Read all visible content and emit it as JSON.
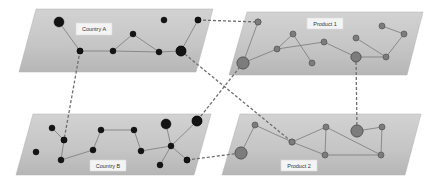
{
  "diagram": {
    "type": "multilayer-network",
    "colors": {
      "plane_fill_top": "#cfcfcf",
      "plane_fill_bottom": "#b9b9b9",
      "country_node": "#141414",
      "product_node": "#7c7c7c",
      "edge": "#7a7a7a",
      "interlayer_link": "#6f6f6f"
    },
    "planes": [
      {
        "id": "country-a",
        "label": "Country A",
        "points": "36,9 213,9 196,72 19,72",
        "label_box": {
          "x": 76,
          "y": 23,
          "w": 36,
          "h": 12
        },
        "node_class": "node-country",
        "nodes": [
          {
            "x": 59,
            "y": 22,
            "r": 5
          },
          {
            "x": 80,
            "y": 51,
            "r": 3
          },
          {
            "x": 113,
            "y": 51,
            "r": 3
          },
          {
            "x": 133,
            "y": 34,
            "r": 3
          },
          {
            "x": 159,
            "y": 52,
            "r": 3
          },
          {
            "x": 164,
            "y": 20,
            "r": 3
          },
          {
            "x": 181,
            "y": 51,
            "r": 5
          },
          {
            "x": 198,
            "y": 20,
            "r": 3
          }
        ],
        "edges": [
          [
            0,
            1
          ],
          [
            1,
            2
          ],
          [
            2,
            3
          ],
          [
            3,
            4
          ],
          [
            2,
            4
          ],
          [
            4,
            6
          ],
          [
            6,
            7
          ]
        ]
      },
      {
        "id": "product-1",
        "label": "Product 1",
        "points": "247,12 423,12 407,75 229,75",
        "label_box": {
          "x": 307,
          "y": 18,
          "w": 36,
          "h": 11
        },
        "node_class": "node-product",
        "nodes": [
          {
            "x": 258,
            "y": 22,
            "r": 3
          },
          {
            "x": 243,
            "y": 63,
            "r": 6
          },
          {
            "x": 277,
            "y": 49,
            "r": 3
          },
          {
            "x": 293,
            "y": 34,
            "r": 3
          },
          {
            "x": 312,
            "y": 63,
            "r": 3
          },
          {
            "x": 324,
            "y": 42,
            "r": 3
          },
          {
            "x": 356,
            "y": 57,
            "r": 5
          },
          {
            "x": 356,
            "y": 38,
            "r": 3
          },
          {
            "x": 386,
            "y": 57,
            "r": 3
          },
          {
            "x": 382,
            "y": 26,
            "r": 3
          },
          {
            "x": 404,
            "y": 34,
            "r": 3
          }
        ],
        "edges": [
          [
            0,
            1
          ],
          [
            1,
            2
          ],
          [
            2,
            3
          ],
          [
            3,
            4
          ],
          [
            2,
            5
          ],
          [
            5,
            6
          ],
          [
            6,
            8
          ],
          [
            7,
            8
          ],
          [
            8,
            10
          ],
          [
            9,
            10
          ]
        ]
      },
      {
        "id": "country-b",
        "label": "Country B",
        "points": "33,114 211,114 194,175 16,175",
        "label_box": {
          "x": 90,
          "y": 160,
          "w": 36,
          "h": 11
        },
        "node_class": "node-country",
        "nodes": [
          {
            "x": 52,
            "y": 128,
            "r": 3
          },
          {
            "x": 64,
            "y": 140,
            "r": 3
          },
          {
            "x": 36,
            "y": 152,
            "r": 3
          },
          {
            "x": 61,
            "y": 160,
            "r": 3
          },
          {
            "x": 101,
            "y": 130,
            "r": 3
          },
          {
            "x": 93,
            "y": 150,
            "r": 3
          },
          {
            "x": 134,
            "y": 130,
            "r": 3
          },
          {
            "x": 141,
            "y": 151,
            "r": 3
          },
          {
            "x": 166,
            "y": 124,
            "r": 5
          },
          {
            "x": 197,
            "y": 121,
            "r": 5
          },
          {
            "x": 171,
            "y": 146,
            "r": 3
          },
          {
            "x": 160,
            "y": 165,
            "r": 3
          },
          {
            "x": 187,
            "y": 160,
            "r": 3
          }
        ],
        "edges": [
          [
            0,
            1
          ],
          [
            1,
            3
          ],
          [
            3,
            5
          ],
          [
            5,
            4
          ],
          [
            4,
            6
          ],
          [
            6,
            7
          ],
          [
            7,
            10
          ],
          [
            8,
            10
          ],
          [
            10,
            9
          ],
          [
            10,
            11
          ],
          [
            10,
            12
          ]
        ]
      },
      {
        "id": "product-2",
        "label": "Product 2",
        "points": "240,114 421,114 405,175 222,175",
        "label_box": {
          "x": 281,
          "y": 160,
          "w": 36,
          "h": 11
        },
        "node_class": "node-product",
        "nodes": [
          {
            "x": 255,
            "y": 125,
            "r": 3
          },
          {
            "x": 241,
            "y": 153,
            "r": 6
          },
          {
            "x": 292,
            "y": 142,
            "r": 3
          },
          {
            "x": 326,
            "y": 127,
            "r": 3
          },
          {
            "x": 325,
            "y": 155,
            "r": 3
          },
          {
            "x": 357,
            "y": 131,
            "r": 6
          },
          {
            "x": 382,
            "y": 127,
            "r": 3
          },
          {
            "x": 381,
            "y": 155,
            "r": 3
          }
        ],
        "edges": [
          [
            0,
            1
          ],
          [
            0,
            2
          ],
          [
            2,
            3
          ],
          [
            3,
            4
          ],
          [
            2,
            4
          ],
          [
            4,
            7
          ],
          [
            3,
            7
          ],
          [
            5,
            6
          ],
          [
            6,
            7
          ]
        ]
      }
    ],
    "interlayer_links": [
      {
        "from": "Country A",
        "to": "Product 1",
        "x1": 198,
        "y1": 20,
        "x2": 258,
        "y2": 22
      },
      {
        "from": "Country A",
        "to": "Country B",
        "x1": 80,
        "y1": 51,
        "x2": 64,
        "y2": 140
      },
      {
        "from": "Country A",
        "to": "Product 2",
        "x1": 181,
        "y1": 51,
        "x2": 292,
        "y2": 142
      },
      {
        "from": "Product 1",
        "to": "Country B",
        "x1": 243,
        "y1": 63,
        "x2": 197,
        "y2": 121
      },
      {
        "from": "Product 1",
        "to": "Product 2",
        "x1": 356,
        "y1": 57,
        "x2": 357,
        "y2": 131
      },
      {
        "from": "Country B",
        "to": "Product 2",
        "x1": 187,
        "y1": 160,
        "x2": 241,
        "y2": 153
      }
    ]
  }
}
